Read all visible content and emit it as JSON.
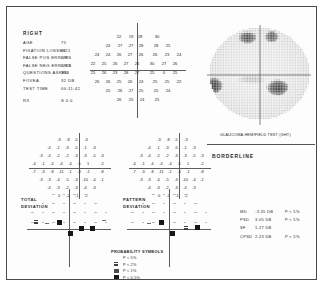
{
  "report": {
    "eye_label": "RIGHT",
    "header_rows": [
      {
        "label": "AGE",
        "value": "75"
      },
      {
        "label": "FIXATION LOSSES",
        "value": "4/21"
      },
      {
        "label": "FALSE POS ERRORS",
        "value": "0/9"
      },
      {
        "label": "FALSE NEG ERRORS",
        "value": "0/13"
      },
      {
        "label": "QUESTIONS ASKED",
        "value": "394"
      },
      {
        "label": "FOVEA",
        "value": "32 DB"
      },
      {
        "label": "TEST TIME",
        "value": "00:11:42"
      },
      {
        "label": "RX",
        "value": "S 0.0"
      }
    ]
  },
  "threshold": {
    "title": "",
    "rows": [
      {
        "y": 27,
        "cells": [
          {
            "x": 112,
            "v": "22"
          },
          {
            "x": 124,
            "v": "19"
          },
          {
            "x": 133,
            "v": "28"
          },
          {
            "x": 150,
            "v": "30"
          }
        ]
      },
      {
        "y": 36,
        "cells": [
          {
            "x": 101,
            "v": "24"
          },
          {
            "x": 113,
            "v": "27"
          },
          {
            "x": 124,
            "v": "27"
          },
          {
            "x": 134,
            "v": "28"
          },
          {
            "x": 149,
            "v": "28"
          },
          {
            "x": 161,
            "v": "25"
          }
        ]
      },
      {
        "y": 45,
        "cells": [
          {
            "x": 90,
            "v": "24"
          },
          {
            "x": 101,
            "v": "24"
          },
          {
            "x": 112,
            "v": "26"
          },
          {
            "x": 123,
            "v": "27"
          },
          {
            "x": 134,
            "v": "26"
          },
          {
            "x": 148,
            "v": "26"
          },
          {
            "x": 160,
            "v": "23"
          },
          {
            "x": 172,
            "v": "24"
          }
        ]
      },
      {
        "y": 54,
        "cells": [
          {
            "x": 86,
            "v": "22"
          },
          {
            "x": 97,
            "v": "25"
          },
          {
            "x": 108,
            "v": "26"
          },
          {
            "x": 119,
            "v": "27"
          },
          {
            "x": 130,
            "v": "26"
          },
          {
            "x": 145,
            "v": "30"
          },
          {
            "x": 157,
            "v": "27"
          },
          {
            "x": 168,
            "v": "26"
          }
        ]
      },
      {
        "y": 63,
        "cells": [
          {
            "x": 86,
            "v": "25"
          },
          {
            "x": 97,
            "v": "26"
          },
          {
            "x": 108,
            "v": "23"
          },
          {
            "x": 119,
            "v": "28"
          },
          {
            "x": 130,
            "v": "27"
          },
          {
            "x": 145,
            "v": "25"
          },
          {
            "x": 157,
            "v": "0"
          },
          {
            "x": 168,
            "v": "25"
          }
        ]
      },
      {
        "y": 72,
        "cells": [
          {
            "x": 90,
            "v": "26"
          },
          {
            "x": 101,
            "v": "26"
          },
          {
            "x": 112,
            "v": "25"
          },
          {
            "x": 123,
            "v": "26"
          },
          {
            "x": 134,
            "v": "24"
          },
          {
            "x": 148,
            "v": "25"
          },
          {
            "x": 160,
            "v": "25"
          },
          {
            "x": 172,
            "v": "22"
          }
        ]
      },
      {
        "y": 81,
        "cells": [
          {
            "x": 101,
            "v": "25"
          },
          {
            "x": 113,
            "v": "26"
          },
          {
            "x": 124,
            "v": "27"
          },
          {
            "x": 134,
            "v": "25"
          },
          {
            "x": 149,
            "v": "25"
          },
          {
            "x": 161,
            "v": "24"
          }
        ]
      },
      {
        "y": 90,
        "cells": [
          {
            "x": 112,
            "v": "26"
          },
          {
            "x": 124,
            "v": "25"
          },
          {
            "x": 135,
            "v": "24"
          },
          {
            "x": 150,
            "v": "25"
          }
        ]
      }
    ]
  },
  "greyscale": {
    "caption": ""
  },
  "ght": {
    "label": "GLAUCOMA HEMIFIELD TEST (GHT)",
    "result": "BORDERLINE"
  },
  "total_deviation": {
    "label_line1": "TOTAL",
    "label_line2": "DEVIATION",
    "rows": [
      {
        "y": 130,
        "cells": [
          {
            "x": 52,
            "v": "-3"
          },
          {
            "x": 61,
            "v": "-8"
          },
          {
            "x": 69,
            "v": "-5"
          },
          {
            "x": 79,
            "v": "-3"
          }
        ]
      },
      {
        "y": 138,
        "cells": [
          {
            "x": 42,
            "v": "-4"
          },
          {
            "x": 51,
            "v": "-1"
          },
          {
            "x": 60,
            "v": "-3"
          },
          {
            "x": 69,
            "v": "-5"
          },
          {
            "x": 78,
            "v": "-1"
          },
          {
            "x": 87,
            "v": "-3"
          }
        ]
      },
      {
        "y": 146,
        "cells": [
          {
            "x": 34,
            "v": "-3"
          },
          {
            "x": 42,
            "v": "-4"
          },
          {
            "x": 51,
            "v": "-2"
          },
          {
            "x": 60,
            "v": "-2"
          },
          {
            "x": 69,
            "v": "-3"
          },
          {
            "x": 78,
            "v": "-3"
          },
          {
            "x": 87,
            "v": "-5"
          },
          {
            "x": 95,
            "v": "-3"
          }
        ]
      },
      {
        "y": 154,
        "cells": [
          {
            "x": 27,
            "v": "-4"
          },
          {
            "x": 36,
            "v": "-1"
          },
          {
            "x": 45,
            "v": "-4"
          },
          {
            "x": 54,
            "v": "-4"
          },
          {
            "x": 63,
            "v": "-4"
          },
          {
            "x": 72,
            "v": "-5"
          },
          {
            "x": 81,
            "v": "1"
          },
          {
            "x": 95,
            "v": "-2"
          }
        ]
      },
      {
        "y": 162,
        "cells": [
          {
            "x": 27,
            "v": "-7"
          },
          {
            "x": 36,
            "v": "-3"
          },
          {
            "x": 45,
            "v": "-8"
          },
          {
            "x": 54,
            "v": "-11"
          },
          {
            "x": 63,
            "v": "-1"
          },
          {
            "x": 72,
            "v": "-3"
          },
          {
            "x": 81,
            "v": "-1"
          },
          {
            "x": 95,
            "v": "-8"
          }
        ]
      },
      {
        "y": 170,
        "cells": [
          {
            "x": 34,
            "v": "-3"
          },
          {
            "x": 42,
            "v": "-3"
          },
          {
            "x": 51,
            "v": "-4"
          },
          {
            "x": 60,
            "v": "-5"
          },
          {
            "x": 69,
            "v": "-3"
          },
          {
            "x": 78,
            "v": "-10"
          },
          {
            "x": 87,
            "v": "-4"
          },
          {
            "x": 95,
            "v": "-1"
          }
        ]
      },
      {
        "y": 178,
        "cells": [
          {
            "x": 42,
            "v": "-4"
          },
          {
            "x": 51,
            "v": "-3"
          },
          {
            "x": 60,
            "v": "-2"
          },
          {
            "x": 69,
            "v": "-3"
          },
          {
            "x": 78,
            "v": "-4"
          },
          {
            "x": 87,
            "v": "-3"
          }
        ]
      },
      {
        "y": 186,
        "cells": [
          {
            "x": 52,
            "v": "0"
          },
          {
            "x": 61,
            "v": "-2"
          },
          {
            "x": 70,
            "v": "-1"
          },
          {
            "x": 79,
            "v": "-2"
          }
        ]
      }
    ]
  },
  "pattern_deviation": {
    "label_line1": "PATTERN",
    "label_line2": "DEVIATION",
    "rows": [
      {
        "y": 130,
        "cells": [
          {
            "x": 152,
            "v": "-3"
          },
          {
            "x": 161,
            "v": "-8"
          },
          {
            "x": 169,
            "v": "-5"
          },
          {
            "x": 179,
            "v": "-3"
          }
        ]
      },
      {
        "y": 138,
        "cells": [
          {
            "x": 142,
            "v": "-4"
          },
          {
            "x": 151,
            "v": "-1"
          },
          {
            "x": 160,
            "v": "-3"
          },
          {
            "x": 169,
            "v": "-5"
          },
          {
            "x": 178,
            "v": "-1"
          },
          {
            "x": 187,
            "v": "-3"
          }
        ]
      },
      {
        "y": 146,
        "cells": [
          {
            "x": 134,
            "v": "-3"
          },
          {
            "x": 142,
            "v": "-4"
          },
          {
            "x": 151,
            "v": "-2"
          },
          {
            "x": 160,
            "v": "-2"
          },
          {
            "x": 169,
            "v": "-3"
          },
          {
            "x": 178,
            "v": "-3"
          },
          {
            "x": 187,
            "v": "-5"
          },
          {
            "x": 195,
            "v": "-3"
          }
        ]
      },
      {
        "y": 154,
        "cells": [
          {
            "x": 127,
            "v": "-4"
          },
          {
            "x": 136,
            "v": "-1"
          },
          {
            "x": 145,
            "v": "-4"
          },
          {
            "x": 154,
            "v": "-4"
          },
          {
            "x": 163,
            "v": "-4"
          },
          {
            "x": 172,
            "v": "-5"
          },
          {
            "x": 181,
            "v": "1"
          },
          {
            "x": 195,
            "v": "-2"
          }
        ]
      },
      {
        "y": 162,
        "cells": [
          {
            "x": 127,
            "v": "-7"
          },
          {
            "x": 136,
            "v": "-3"
          },
          {
            "x": 145,
            "v": "-8"
          },
          {
            "x": 154,
            "v": "-11"
          },
          {
            "x": 163,
            "v": "-1"
          },
          {
            "x": 172,
            "v": "-3"
          },
          {
            "x": 181,
            "v": "-1"
          },
          {
            "x": 195,
            "v": "-8"
          }
        ]
      },
      {
        "y": 170,
        "cells": [
          {
            "x": 134,
            "v": "-3"
          },
          {
            "x": 142,
            "v": "-3"
          },
          {
            "x": 151,
            "v": "-4"
          },
          {
            "x": 160,
            "v": "-5"
          },
          {
            "x": 169,
            "v": "-3"
          },
          {
            "x": 178,
            "v": "-10"
          },
          {
            "x": 187,
            "v": "-4"
          },
          {
            "x": 195,
            "v": "-1"
          }
        ]
      },
      {
        "y": 178,
        "cells": [
          {
            "x": 142,
            "v": "-4"
          },
          {
            "x": 151,
            "v": "-3"
          },
          {
            "x": 160,
            "v": "-2"
          },
          {
            "x": 169,
            "v": "-3"
          },
          {
            "x": 178,
            "v": "-4"
          },
          {
            "x": 187,
            "v": "-3"
          }
        ]
      },
      {
        "y": 186,
        "cells": [
          {
            "x": 152,
            "v": "0"
          },
          {
            "x": 161,
            "v": "-2"
          },
          {
            "x": 170,
            "v": "-1"
          },
          {
            "x": 179,
            "v": "-2"
          }
        ]
      }
    ]
  },
  "probability_symbols": {
    "title": "PROBABILITY SYMBOLS",
    "items": [
      {
        "label": "P < 5%",
        "level": 1
      },
      {
        "label": "P < 2%",
        "level": 2
      },
      {
        "label": "P < 1%",
        "level": 3
      },
      {
        "label": "P < 0.5%",
        "level": 4
      }
    ]
  },
  "global_indices": [
    {
      "name": "MD",
      "value": "-3.35 DB",
      "prob": "P < 5%"
    },
    {
      "name": "PSD",
      "value": "3.05 DB",
      "prob": "P < 5%"
    },
    {
      "name": "SF",
      "value": "1.27 DB",
      "prob": ""
    },
    {
      "name": "CPSD",
      "value": "2.23 DB",
      "prob": "P < 5%"
    }
  ],
  "td_plot_symbols": [
    {
      "x": 27,
      "y": 213,
      "level": 2
    },
    {
      "x": 38,
      "y": 216,
      "level": 1
    },
    {
      "x": 50,
      "y": 213,
      "level": 4
    },
    {
      "x": 61,
      "y": 224,
      "level": 4
    },
    {
      "x": 72,
      "y": 219,
      "level": 4
    },
    {
      "x": 83,
      "y": 219,
      "level": 4
    },
    {
      "x": 95,
      "y": 213,
      "level": 1
    }
  ],
  "pd_plot_symbols": [
    {
      "x": 140,
      "y": 216,
      "level": 1
    },
    {
      "x": 152,
      "y": 213,
      "level": 4
    },
    {
      "x": 163,
      "y": 224,
      "level": 4
    },
    {
      "x": 177,
      "y": 219,
      "level": 2
    },
    {
      "x": 188,
      "y": 218,
      "level": 4
    }
  ]
}
